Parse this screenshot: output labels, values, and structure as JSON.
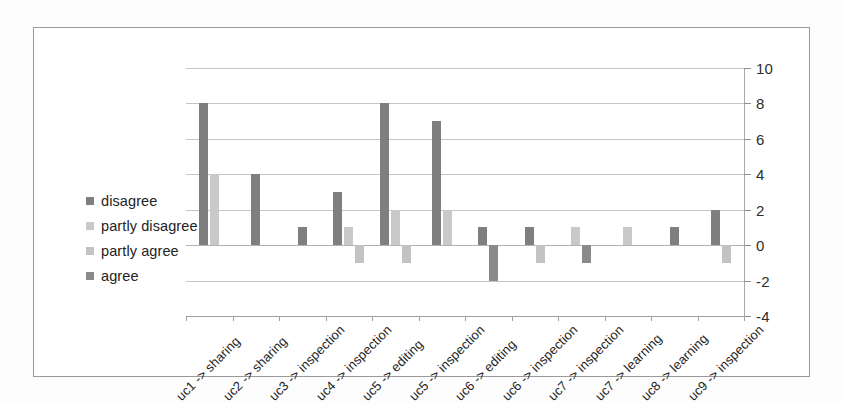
{
  "figure": {
    "background_color": "#ffffff",
    "border_color": "#9a9a9a"
  },
  "legend": {
    "position": "inside-left",
    "items": [
      {
        "label": "disagree",
        "color": "#7f7f7f"
      },
      {
        "label": "partly disagree",
        "color": "#c9c9c9"
      },
      {
        "label": "partly agree",
        "color": "#c3c3c3"
      },
      {
        "label": "agree",
        "color": "#8a8a8a"
      }
    ]
  },
  "chart_data": {
    "type": "bar",
    "title": "",
    "xlabel": "",
    "ylabel": "",
    "ylim": [
      -4,
      10
    ],
    "yticks": [
      -4,
      -2,
      0,
      2,
      4,
      6,
      8,
      10
    ],
    "ytick_labels": [
      "-4",
      "-2",
      "0",
      "2",
      "4",
      "6",
      "8",
      "10"
    ],
    "grid": true,
    "grid_axis": "y",
    "legend_position": "inside-left",
    "categories": [
      "uc1 -> sharing",
      "uc2 -> sharing",
      "uc3 -> inspection",
      "uc4 -> inspection",
      "uc5 -> editing",
      "uc5 -> inspection",
      "uc6 -> editing",
      "uc6 -> inspection",
      "uc7 -> inspection",
      "uc7 -> learning",
      "uc8 -> learning",
      "uc9 -> inspection"
    ],
    "series": [
      {
        "name": "disagree",
        "color": "#7f7f7f",
        "values": [
          8,
          4,
          1,
          3,
          8,
          7,
          1,
          1,
          0,
          0,
          1,
          2
        ]
      },
      {
        "name": "partly disagree",
        "color": "#c9c9c9",
        "values": [
          4,
          0,
          0,
          1,
          2,
          2,
          0,
          0,
          1,
          1,
          0,
          0
        ]
      },
      {
        "name": "partly agree",
        "color": "#c3c3c3",
        "values": [
          0,
          0,
          0,
          -1,
          -1,
          0,
          0,
          -1,
          0,
          0,
          0,
          -1
        ]
      },
      {
        "name": "agree",
        "color": "#8a8a8a",
        "values": [
          0,
          0,
          0,
          0,
          0,
          0,
          -2,
          0,
          -1,
          0,
          0,
          0
        ]
      }
    ]
  }
}
